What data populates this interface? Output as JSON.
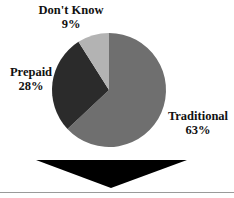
{
  "chart_data": {
    "type": "pie",
    "title": "",
    "slices": [
      {
        "label": "Traditional",
        "value": 63,
        "pct_text": "63%",
        "color": "#6f6f6f"
      },
      {
        "label": "Prepaid",
        "value": 28,
        "pct_text": "28%",
        "color": "#2b2b2b"
      },
      {
        "label": "Don't Know",
        "value": 9,
        "pct_text": "9%",
        "color": "#b3b3b3"
      }
    ]
  },
  "decor": {
    "arrow_color": "#000000",
    "rule_color": "#9a9a9a"
  }
}
